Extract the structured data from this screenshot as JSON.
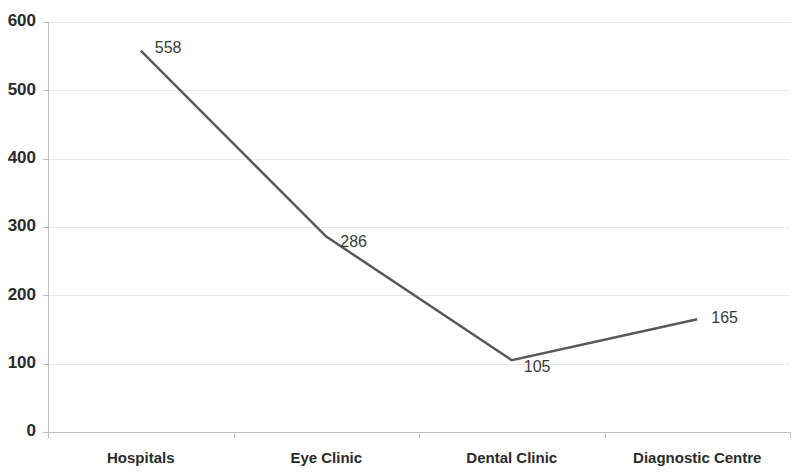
{
  "chart_data": {
    "type": "line",
    "title": "",
    "subtitle": "",
    "xlabel": "",
    "ylabel": "",
    "categories": [
      "Hospitals",
      "Eye Clinic",
      "Dental Clinic",
      "Diagnostic Centre"
    ],
    "values": [
      558,
      286,
      105,
      165
    ],
    "series": [
      {
        "name": "",
        "values": [
          558,
          286,
          105,
          165
        ]
      }
    ],
    "point_labels": [
      "558",
      "286",
      "105",
      "165"
    ],
    "ylim": [
      0,
      600
    ],
    "ytick_values": [
      0,
      100,
      200,
      300,
      400,
      500,
      600
    ],
    "ytick_labels": [
      "0",
      "100",
      "200",
      "300",
      "400",
      "500",
      "600"
    ],
    "grid": {
      "horizontal": true,
      "vertical": false,
      "color": "#e8e8e8"
    },
    "legend": {
      "visible": false,
      "position": "none",
      "entries": []
    },
    "colors": {
      "line": "#595959",
      "axis": "#bfbfbf",
      "grid": "#e8e8e8",
      "text": "#2b2b2b",
      "label": "#3a3a3a",
      "background": "#ffffff"
    },
    "line_width": 2.5,
    "markers": false,
    "annotations": []
  }
}
